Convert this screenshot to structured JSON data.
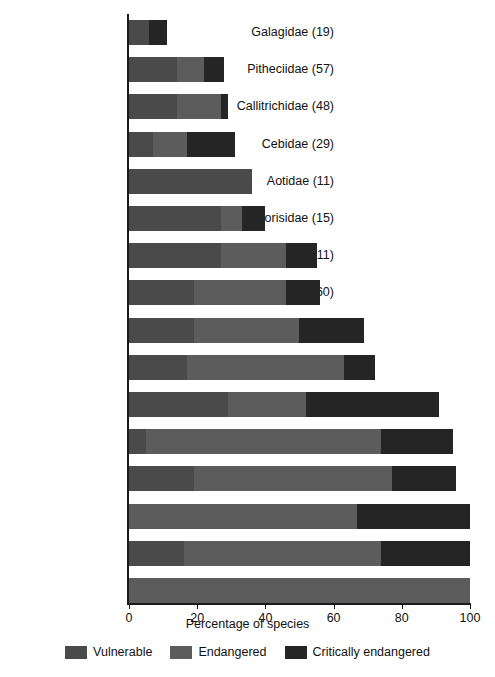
{
  "chart_data": {
    "type": "bar",
    "orientation": "horizontal",
    "stacked": true,
    "title": "",
    "xlabel": "Percentage of species",
    "ylabel": "",
    "xlim": [
      0,
      100
    ],
    "xticks": [
      0,
      20,
      40,
      60,
      80,
      100
    ],
    "xtick_labels": [
      "0",
      "20",
      "40",
      "60",
      "80",
      "100"
    ],
    "grid": false,
    "legend_position": "bottom",
    "categories": [
      "Galagidae (19)",
      "Pitheciidae (57)",
      "Callitrichidae (48)",
      "Cebidae (29)",
      "Aotidae (11)",
      "Lorisidae (15)",
      "Tarsiidae (11)",
      "Cercopithecidae (160)",
      "Atelidae (26)",
      "Cheirogaleidae (36)",
      "Lemuridae (21)",
      "Hylobatidae (19)",
      "Lepilemuridae (26)",
      "Hominidae (6)",
      "Indriidae (19)",
      "Daubentoniidae (1)"
    ],
    "series": [
      {
        "name": "Vulnerable",
        "color": "#4a4a4a",
        "values": [
          6,
          14,
          14,
          7,
          36,
          27,
          27,
          19,
          19,
          17,
          29,
          5,
          19,
          0,
          16,
          0
        ]
      },
      {
        "name": "Endangered",
        "color": "#5c5c5c",
        "values": [
          0,
          8,
          13,
          10,
          0,
          6,
          19,
          27,
          31,
          46,
          23,
          69,
          58,
          67,
          58,
          100
        ]
      },
      {
        "name": "Critically endangered",
        "color": "#252525",
        "values": [
          5,
          6,
          2,
          14,
          0,
          7,
          9,
          10,
          19,
          9,
          39,
          21,
          19,
          33,
          26,
          0
        ]
      }
    ],
    "totals": [
      11,
      28,
      29,
      31,
      36,
      40,
      55,
      56,
      69,
      72,
      91,
      95,
      96,
      100,
      100,
      100
    ]
  },
  "legend": {
    "items": [
      {
        "label": "Vulnerable",
        "color": "#4a4a4a"
      },
      {
        "label": "Endangered",
        "color": "#5c5c5c"
      },
      {
        "label": "Critically endangered",
        "color": "#252525"
      }
    ]
  }
}
